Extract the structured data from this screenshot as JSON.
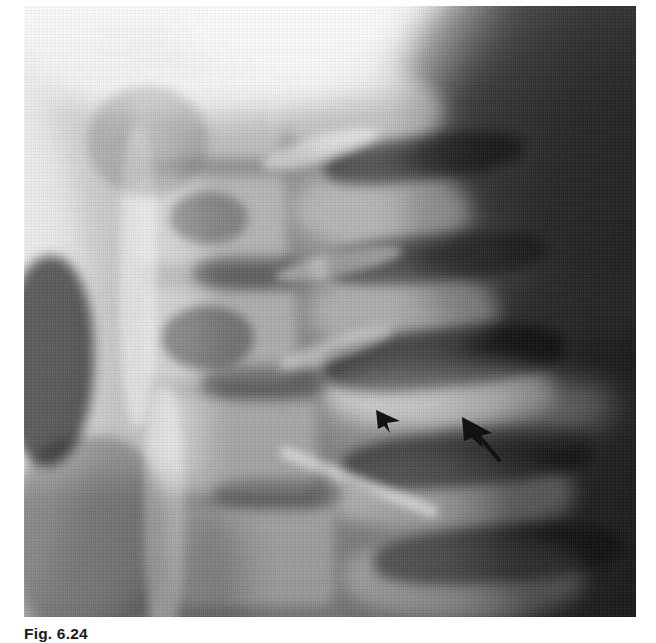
{
  "figure": {
    "caption": "Fig. 6.24",
    "caption_truncated": true,
    "modality": "radiograph",
    "view": "lateral cervical spine",
    "alt": "Lateral cervical spine radiograph showing vertebral bodies, intervertebral disc spaces and posterior elements; two black arrows in the lower right quadrant indicate an abnormality at a facet / disc level",
    "background_color": "#ffffff",
    "film_tone": "#8f8f8f",
    "dark_tone": "#2b2b2b",
    "bright_tone": "#e8e8e8",
    "plate": {
      "x": 24,
      "y": 6,
      "width": 612,
      "height": 611
    }
  },
  "annotations": {
    "markers": [
      {
        "name": "arrowhead-marker-left",
        "label": "arrow 1",
        "type": "solid-arrowhead",
        "color": "#121212",
        "x": 374,
        "y": 406,
        "width": 30,
        "height": 30,
        "direction": "up-left",
        "has_tail": false
      },
      {
        "name": "arrow-marker-right",
        "label": "arrow 2",
        "type": "solid-arrow-with-tail",
        "color": "#121212",
        "x": 459,
        "y": 415,
        "width": 44,
        "height": 46,
        "direction": "up-left",
        "has_tail": true
      }
    ]
  }
}
